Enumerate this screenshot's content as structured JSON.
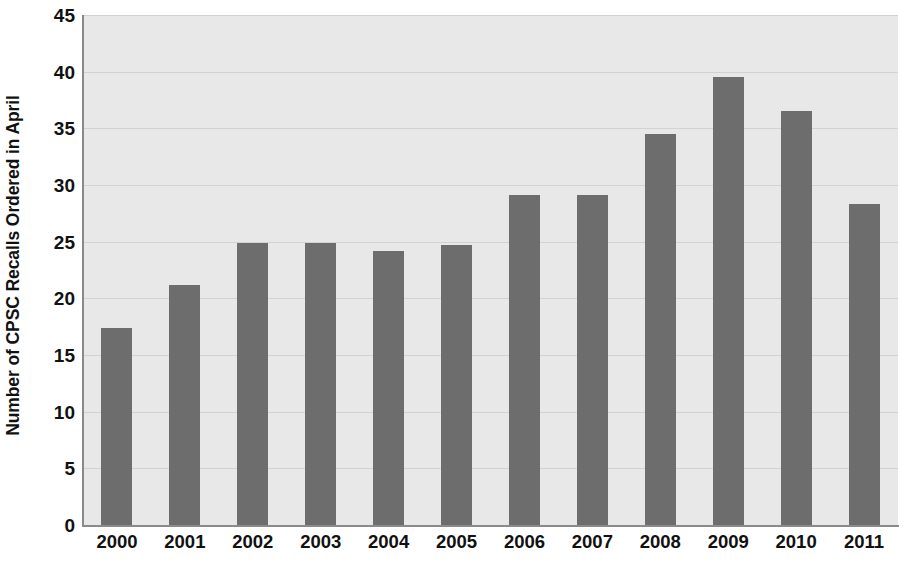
{
  "chart_data": {
    "type": "bar",
    "title": "",
    "xlabel": "",
    "ylabel": "Number of CPSC Recalls Ordered in April",
    "categories": [
      "2000",
      "2001",
      "2002",
      "2003",
      "2004",
      "2005",
      "2006",
      "2007",
      "2008",
      "2009",
      "2010",
      "2011"
    ],
    "values": [
      17.4,
      21.2,
      24.9,
      24.9,
      24.2,
      24.7,
      29.1,
      29.1,
      34.5,
      39.5,
      36.5,
      28.3
    ],
    "ylim": [
      0,
      45
    ],
    "y_ticks": [
      0,
      5,
      10,
      15,
      20,
      25,
      30,
      35,
      40,
      45
    ],
    "y_tick_labels": [
      "0",
      "5",
      "10",
      "15",
      "20",
      "25",
      "30",
      "35",
      "40",
      "45"
    ],
    "grid": true,
    "grid_axis": "y",
    "legend": false,
    "legend_position": "none",
    "bar_color": "#6d6d6d",
    "plot_background": "#e8e8e8",
    "gridline_color": "#d2d2d2",
    "axis_color": "#8a8a8a",
    "text_color": "#111111"
  }
}
